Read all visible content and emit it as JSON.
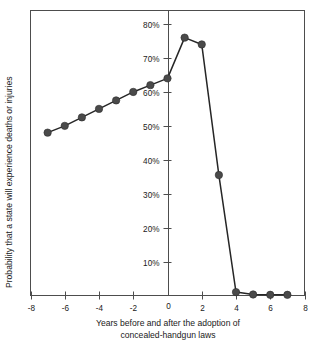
{
  "chart_data": {
    "type": "line",
    "title": "",
    "subtitle": "",
    "xlabel": "Years before and after the adoption of concealed-handgun laws",
    "xlabel_line1": "Years before and after the adoption of",
    "xlabel_line2": "concealed-handgun laws",
    "ylabel": "Probability that a state will experience deaths or injuries",
    "xlim": [
      -8,
      8
    ],
    "ylim": [
      0,
      84
    ],
    "grid": false,
    "legend": "none",
    "x_ticks": [
      -8,
      -6,
      -4,
      -2,
      0,
      2,
      4,
      6,
      8
    ],
    "x_tick_labels": [
      "-8",
      "-6",
      "-4",
      "-2",
      "0",
      "2",
      "4",
      "6",
      "8"
    ],
    "y_ticks": [
      10,
      20,
      30,
      40,
      50,
      60,
      70,
      80
    ],
    "y_tick_labels": [
      "10%",
      "20%",
      "30%",
      "40%",
      "50%",
      "60%",
      "70%",
      "80%"
    ],
    "series": [
      {
        "name": "Probability of deaths or injuries",
        "color": "#4a4a4a",
        "x": [
          -7,
          -6,
          -5,
          -4,
          -3,
          -2,
          -1,
          0,
          1,
          2,
          3,
          4,
          5,
          6,
          7
        ],
        "values": [
          48,
          50,
          52.5,
          55,
          57.5,
          60,
          62,
          64,
          76,
          74,
          35.5,
          1,
          0.3,
          0.2,
          0.2
        ]
      }
    ],
    "annotations": []
  },
  "axes": {
    "y_axis_name": "vertical-axis",
    "x_axis_name": "horizontal-axis"
  }
}
